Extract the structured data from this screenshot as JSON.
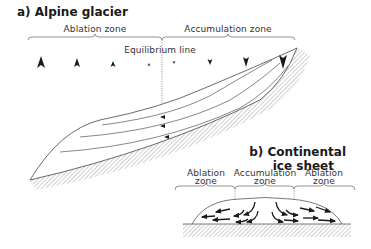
{
  "panel_a": {
    "title": "a) Alpine glacier",
    "zones": [
      {
        "label": "Ablation zone"
      },
      {
        "label": "Accumulation zone"
      }
    ],
    "equilibrium_label": "Equilibrium line",
    "mass_balance_arrows": {
      "ablation": [
        "upward-arrow-large",
        "upward-arrow-medium",
        "upward-arrow-small",
        "upward-arrow-tiny"
      ],
      "accumulation": [
        "downward-arrow-tiny",
        "downward-arrow-small",
        "downward-arrow-medium",
        "downward-arrow-large"
      ]
    }
  },
  "panel_b": {
    "title_line1": "b) Continental",
    "title_line2": "ice sheet",
    "zones": [
      {
        "line1": "Ablation",
        "line2": "zone"
      },
      {
        "line1": "Accumulation",
        "line2": "zone"
      },
      {
        "line1": "Ablation",
        "line2": "zone"
      }
    ]
  },
  "colors": {
    "ink": "#1a1a1a",
    "line": "#555555",
    "hatch": "#8a8a8a"
  }
}
